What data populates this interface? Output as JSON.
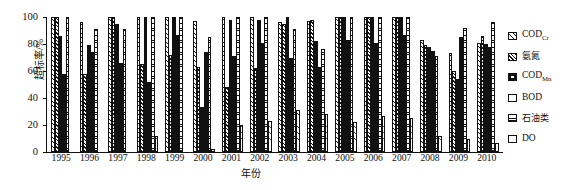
{
  "chart_data": {
    "type": "bar",
    "title": "",
    "xlabel": "年份",
    "ylabel": "超标率/%",
    "ylim": [
      0,
      100
    ],
    "yticks": [
      0,
      20,
      40,
      60,
      80,
      100
    ],
    "grid": false,
    "legend_position": "right",
    "categories": [
      "1995",
      "1996",
      "1997",
      "1998",
      "1999",
      "2000",
      "2001",
      "2002",
      "2003",
      "2004",
      "2005",
      "2006",
      "2007",
      "2008",
      "2009",
      "2010"
    ],
    "series": [
      {
        "name": "COD_Cr",
        "label": "CODCr",
        "pattern": "diagonal-sparse",
        "values": [
          100,
          96,
          100,
          100,
          100,
          97,
          100,
          100,
          96,
          97,
          100,
          100,
          100,
          83,
          73,
          81
        ]
      },
      {
        "name": "ammonia",
        "label": "氨氮",
        "pattern": "diagonal-dense",
        "values": [
          100,
          58,
          100,
          65,
          72,
          63,
          48,
          62,
          95,
          98,
          100,
          100,
          100,
          79,
          60,
          86
        ]
      },
      {
        "name": "COD_Mn",
        "label": "CODMn",
        "pattern": "checker",
        "values": [
          86,
          79,
          95,
          100,
          100,
          33,
          98,
          98,
          100,
          82,
          100,
          100,
          100,
          78,
          54,
          80
        ]
      },
      {
        "name": "BOD",
        "label": "BOD",
        "pattern": "solid-black",
        "values": [
          58,
          74,
          66,
          52,
          87,
          74,
          71,
          81,
          70,
          63,
          83,
          81,
          87,
          75,
          85,
          78
        ]
      },
      {
        "name": "oil",
        "label": "石油类",
        "pattern": "horizontal-lines",
        "values": [
          100,
          91,
          91,
          100,
          100,
          85,
          100,
          100,
          91,
          76,
          100,
          100,
          100,
          71,
          92,
          96
        ]
      },
      {
        "name": "DO",
        "label": "DO",
        "pattern": "dotted-light",
        "values": [
          0,
          0,
          0,
          12,
          0,
          2,
          20,
          23,
          31,
          28,
          22,
          27,
          25,
          12,
          10,
          7
        ]
      }
    ]
  },
  "legend": {
    "items": [
      {
        "label_main": "COD",
        "label_sub": "Cr",
        "swatch": "codcr-swatch"
      },
      {
        "label_main": "氨氮",
        "label_sub": "",
        "swatch": "ammonia-swatch"
      },
      {
        "label_main": "COD",
        "label_sub": "Mn",
        "swatch": "codmn-swatch"
      },
      {
        "label_main": "BOD",
        "label_sub": "",
        "swatch": "bod-swatch"
      },
      {
        "label_main": "石油类",
        "label_sub": "",
        "swatch": "oil-swatch"
      },
      {
        "label_main": "DO",
        "label_sub": "",
        "swatch": "do-swatch"
      }
    ]
  }
}
